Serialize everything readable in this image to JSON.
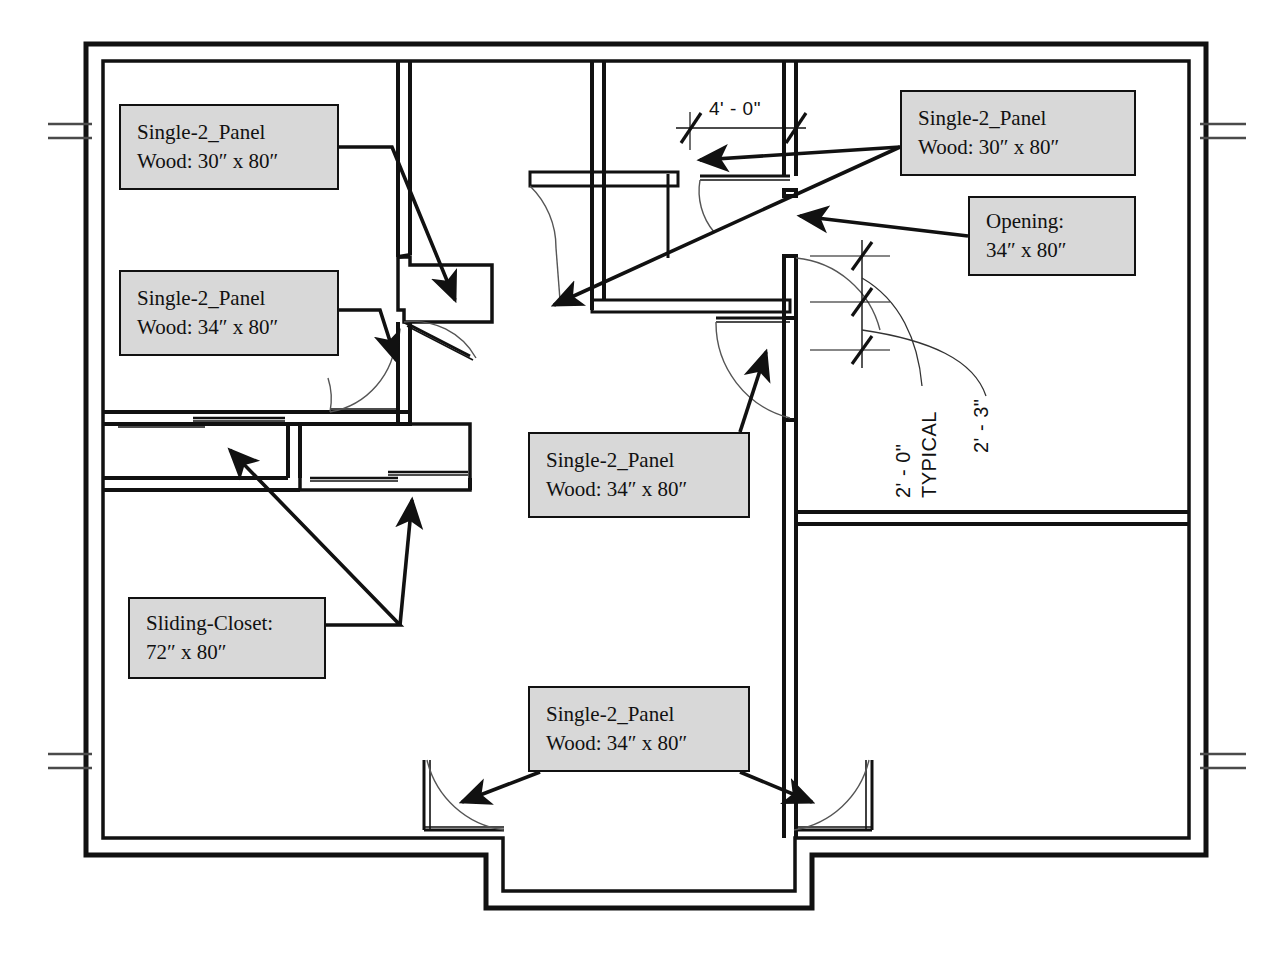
{
  "drawing": {
    "type": "architectural-floor-plan",
    "title": "Residential Floor Plan with Door Schedule Callouts",
    "background_color": "#ffffff",
    "line_color": "#111111",
    "callout_fill": "#d8d8d8",
    "callout_border": "#111111"
  },
  "callouts": [
    {
      "id": "door-nw-top",
      "name": "single-2-panel-30-top-left",
      "line1": "Single-2_Panel",
      "line2": "Wood: 30″ x 80″",
      "x": 119,
      "y": 104,
      "width": 220,
      "height": 86
    },
    {
      "id": "door-nw-bottom",
      "name": "single-2-panel-34-left",
      "line1": "Single-2_Panel",
      "line2": "Wood: 34″ x 80″",
      "x": 119,
      "y": 270,
      "width": 220,
      "height": 86
    },
    {
      "id": "closet-sliding",
      "name": "sliding-closet-72",
      "line1": "Sliding-Closet:",
      "line2": "72″ x 80″",
      "x": 128,
      "y": 597,
      "width": 198,
      "height": 82
    },
    {
      "id": "door-center",
      "name": "single-2-panel-34-center",
      "line1": "Single-2_Panel",
      "line2": "Wood: 34″ x 80″",
      "x": 528,
      "y": 432,
      "width": 222,
      "height": 86
    },
    {
      "id": "door-entry",
      "name": "single-2-panel-34-entry",
      "line1": "Single-2_Panel",
      "line2": "Wood: 34″ x 80″",
      "x": 528,
      "y": 686,
      "width": 222,
      "height": 86
    },
    {
      "id": "door-ne",
      "name": "single-2-panel-30-top-right",
      "line1": "Single-2_Panel",
      "line2": "Wood: 30″ x 80″",
      "x": 900,
      "y": 90,
      "width": 236,
      "height": 86
    },
    {
      "id": "opening-ne",
      "name": "opening-34",
      "line1": "Opening:",
      "line2": "34″ x 80″",
      "x": 968,
      "y": 196,
      "width": 168,
      "height": 80
    }
  ],
  "dimensions": [
    {
      "id": "dim-4-0",
      "name": "dimension-4-0",
      "label": "4' - 0\"",
      "orientation": "horizontal",
      "x": 709,
      "y": 98
    },
    {
      "id": "dim-2-0-typ",
      "name": "dimension-2-0-typical",
      "label": "2' - 0\"",
      "label2": "TYPICAL",
      "orientation": "vertical",
      "x": 930,
      "y": 460
    },
    {
      "id": "dim-2-3",
      "name": "dimension-2-3",
      "label": "2' - 3\"",
      "orientation": "vertical",
      "x": 1000,
      "y": 415
    }
  ],
  "legend_notes": {
    "door_types": [
      "Single-2_Panel",
      "Sliding-Closet",
      "Opening"
    ],
    "materials": [
      "Wood"
    ],
    "sizes": [
      "30″ x 80″",
      "34″ x 80″",
      "72″ x 80″"
    ]
  }
}
